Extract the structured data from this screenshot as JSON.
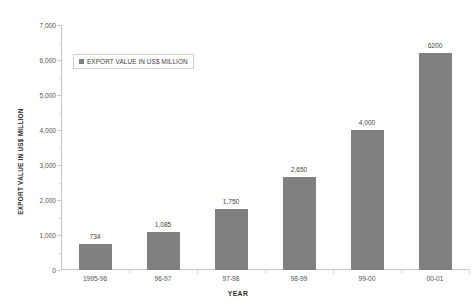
{
  "chart_data": {
    "type": "bar",
    "title": "",
    "subtitle": "",
    "xlabel": "YEAR",
    "ylabel": "EXPORT VALUE IN US$ MILLION",
    "categories": [
      "1995-96",
      "96-97",
      "97-98",
      "98-99",
      "99-00",
      "00-01"
    ],
    "values": [
      734,
      1085,
      1750,
      2650,
      4000,
      6200
    ],
    "value_labels": [
      "734",
      "1,085",
      "1,750",
      "2,650",
      "4,000",
      "6200"
    ],
    "series": [
      {
        "name": "EXPORT VALUE IN US$ MILLION",
        "values": [
          734,
          1085,
          1750,
          2650,
          4000,
          6200
        ],
        "color": "#808080"
      }
    ],
    "ylim": [
      0,
      7000
    ],
    "y_tick_values": [
      0,
      1000,
      2000,
      3000,
      4000,
      5000,
      6000,
      7000
    ],
    "y_tick_labels": [
      "0",
      "1,000",
      "2,000",
      "3,000",
      "4,000",
      "5,000",
      "6,000",
      "7,000"
    ],
    "grid": false,
    "legend_position": "inside-top-left",
    "legend_entries": [
      "EXPORT VALUE IN US$ MILLION"
    ],
    "background_color": "#ffffff",
    "axis_color": "#c9c9c9"
  },
  "legend": {
    "label": "EXPORT VALUE IN US$ MILLION",
    "swatch_name": "series-color-swatch"
  },
  "axes": {
    "y_title": "EXPORT VALUE IN US$ MILLION",
    "x_title": "YEAR"
  }
}
